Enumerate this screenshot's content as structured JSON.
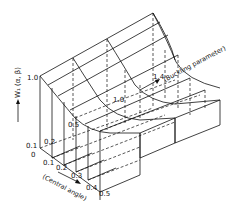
{
  "figure": {
    "type": "3d-surface-wireframe",
    "z_axis": {
      "label": "W₁ (α, β)",
      "ticks": [
        "1.0",
        "0.1"
      ]
    },
    "x_axis": {
      "label": "(Central angle)",
      "ticks": [
        "0",
        "0.1",
        "0.2",
        "0.3",
        "0.4",
        "0.5"
      ]
    },
    "y_axis": {
      "label": "(Buckling parameter)",
      "ticks": [
        "0.2",
        "0.5",
        "1.0",
        "1.4"
      ]
    }
  }
}
